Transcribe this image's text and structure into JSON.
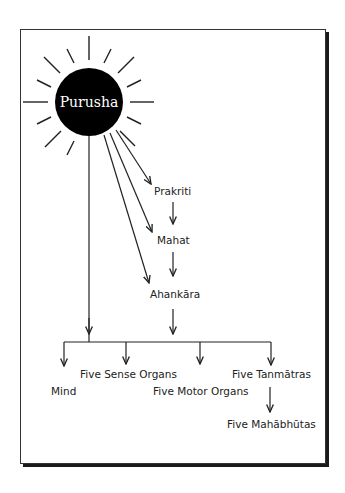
{
  "diagram": {
    "center": {
      "label": "Purusha"
    },
    "nodes": {
      "prakriti": "Prakriti",
      "mahat": "Mahat",
      "ahankara": "Ahankāra",
      "mind": "Mind",
      "sense_organs": "Five Sense Organs",
      "motor_organs": "Five Motor Organs",
      "tanmatras": "Five Tanmātras",
      "mahabhutas": "Five Mahābhūtas"
    },
    "colors": {
      "ink": "#222222",
      "sun": "#000000",
      "background": "#ffffff"
    }
  }
}
